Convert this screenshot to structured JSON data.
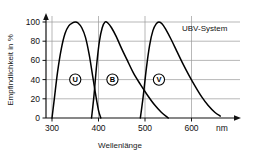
{
  "chart_data": {
    "type": "line",
    "title": "",
    "annotation": "UBV-System",
    "xlabel": "Wellenlänge",
    "xunit": "nm",
    "ylabel": "Empfindlichkeit in %",
    "xlim": [
      280,
      680
    ],
    "ylim": [
      0,
      105
    ],
    "grid": true,
    "legend_position": "inline-circled-markers",
    "xticks": [
      300,
      400,
      500,
      600
    ],
    "xticklabels": [
      "300",
      "400",
      "500",
      "600"
    ],
    "yticks": [
      0,
      20,
      40,
      60,
      80,
      100
    ],
    "yticklabels": [
      "0",
      "20",
      "40",
      "60",
      "80",
      "100"
    ],
    "series": [
      {
        "name": "U",
        "marker_label": "U",
        "marker_x": 350,
        "marker_y": 40,
        "color": "#000000",
        "x": [
          300,
          305,
          312,
          320,
          328,
          336,
          344,
          350,
          356,
          364,
          372,
          380,
          388,
          394,
          400,
          405
        ],
        "y": [
          0,
          20,
          48,
          72,
          88,
          96,
          99,
          100,
          99,
          94,
          84,
          66,
          42,
          24,
          8,
          0
        ]
      },
      {
        "name": "B",
        "marker_label": "B",
        "marker_x": 430,
        "marker_y": 40,
        "color": "#000000",
        "x": [
          385,
          390,
          396,
          402,
          408,
          414,
          420,
          428,
          438,
          450,
          462,
          475,
          490,
          505,
          520,
          535,
          550
        ],
        "y": [
          0,
          22,
          55,
          80,
          94,
          100,
          99,
          94,
          85,
          72,
          60,
          47,
          35,
          24,
          14,
          6,
          0
        ]
      },
      {
        "name": "V",
        "marker_label": "V",
        "marker_x": 530,
        "marker_y": 40,
        "color": "#000000",
        "x": [
          490,
          496,
          503,
          510,
          517,
          524,
          530,
          537,
          545,
          556,
          568,
          580,
          594,
          608,
          622,
          636,
          650,
          662
        ],
        "y": [
          0,
          22,
          52,
          76,
          91,
          98,
          100,
          98,
          92,
          82,
          70,
          58,
          45,
          33,
          22,
          13,
          6,
          2
        ]
      }
    ]
  },
  "axes": {
    "y_title": "Empfindlichkeit in %",
    "x_title": "Wellenlänge",
    "x_unit": "nm"
  },
  "annotations": {
    "system_label": "UBV-System"
  },
  "colors": {
    "curve": "#000000",
    "grid": "#9a9a9a",
    "axis": "#111111",
    "background": "#ffffff"
  }
}
